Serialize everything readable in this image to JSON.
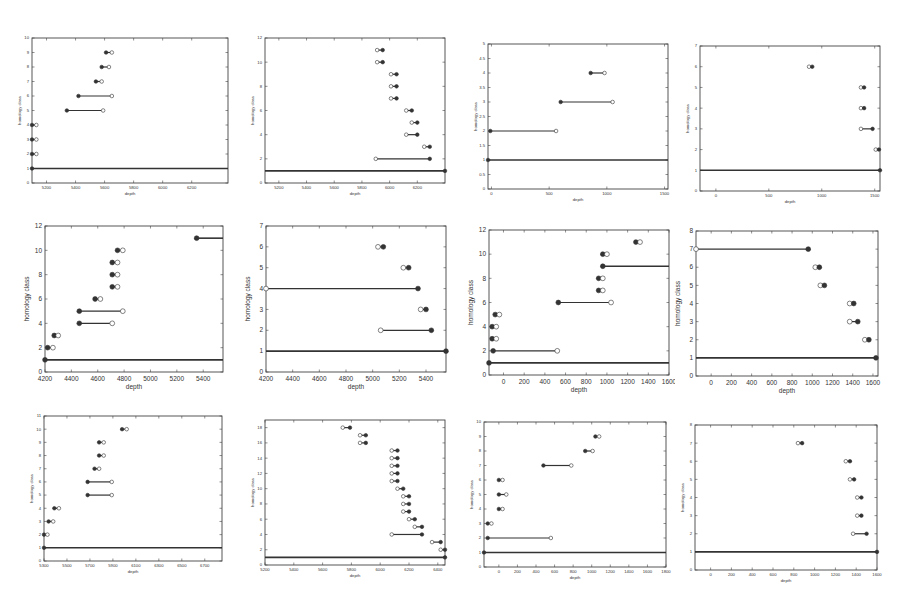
{
  "figure": {
    "common_xlabel": "depth",
    "common_ylabel": "homology class"
  },
  "chart_data": [
    {
      "id": "p1",
      "type": "interval",
      "row": 0,
      "col": 0,
      "xlabel": "depth",
      "ylabel": "homology class",
      "xlim": [
        5100,
        6450
      ],
      "ylim": [
        0,
        10
      ],
      "xticks": [
        5200,
        5400,
        5600,
        5800,
        6000,
        6200
      ],
      "yticks": [
        0,
        1,
        2,
        3,
        4,
        5,
        6,
        7,
        8,
        9,
        10
      ],
      "intervals": [
        {
          "y": 1,
          "x0": 5100,
          "x1": 6450,
          "infinite": true
        },
        {
          "y": 2,
          "x0": 5100,
          "x1": 5130
        },
        {
          "y": 3,
          "x0": 5100,
          "x1": 5130
        },
        {
          "y": 4,
          "x0": 5100,
          "x1": 5130
        },
        {
          "y": 5,
          "x0": 5340,
          "x1": 5590
        },
        {
          "y": 6,
          "x0": 5420,
          "x1": 5650
        },
        {
          "y": 7,
          "x0": 5540,
          "x1": 5580
        },
        {
          "y": 8,
          "x0": 5580,
          "x1": 5630
        },
        {
          "y": 9,
          "x0": 5610,
          "x1": 5650
        }
      ],
      "direction": "filled-start"
    },
    {
      "id": "p2",
      "type": "interval",
      "row": 0,
      "col": 1,
      "xlabel": "depth",
      "ylabel": "homology class",
      "xlim": [
        5100,
        6400
      ],
      "ylim": [
        0,
        12
      ],
      "xticks": [
        5200,
        5400,
        5600,
        5800,
        6000,
        6200
      ],
      "yticks": [
        0,
        2,
        4,
        6,
        8,
        10,
        12
      ],
      "intervals": [
        {
          "y": 1,
          "x0": 5100,
          "x1": 6400,
          "infinite": true
        },
        {
          "y": 2,
          "x0": 5900,
          "x1": 6290
        },
        {
          "y": 3,
          "x0": 6250,
          "x1": 6290
        },
        {
          "y": 4,
          "x0": 6120,
          "x1": 6200
        },
        {
          "y": 5,
          "x0": 6160,
          "x1": 6200
        },
        {
          "y": 6,
          "x0": 6120,
          "x1": 6160
        },
        {
          "y": 7,
          "x0": 6010,
          "x1": 6050
        },
        {
          "y": 8,
          "x0": 6010,
          "x1": 6050
        },
        {
          "y": 9,
          "x0": 6010,
          "x1": 6050
        },
        {
          "y": 10,
          "x0": 5910,
          "x1": 5950
        },
        {
          "y": 11,
          "x0": 5910,
          "x1": 5950
        }
      ],
      "direction": "filled-end"
    },
    {
      "id": "p3",
      "type": "interval",
      "row": 0,
      "col": 2,
      "xlabel": "depth",
      "ylabel": "homology class",
      "xlim": [
        -30,
        1530
      ],
      "ylim": [
        0,
        5
      ],
      "xticks": [
        0,
        500,
        1000,
        1500
      ],
      "yticks": [
        0,
        0.5,
        1,
        1.5,
        2,
        2.5,
        3,
        3.5,
        4,
        4.5,
        5
      ],
      "intervals": [
        {
          "y": 1,
          "x0": -30,
          "x1": 1530,
          "infinite": true
        },
        {
          "y": 2,
          "x0": -10,
          "x1": 560
        },
        {
          "y": 3,
          "x0": 600,
          "x1": 1050
        },
        {
          "y": 4,
          "x0": 860,
          "x1": 980
        }
      ],
      "direction": "filled-start"
    },
    {
      "id": "p4",
      "type": "interval",
      "row": 0,
      "col": 3,
      "xlabel": "depth",
      "ylabel": "homology class",
      "xlim": [
        -150,
        1550
      ],
      "ylim": [
        0,
        7
      ],
      "xticks": [
        0,
        500,
        1000,
        1500
      ],
      "yticks": [
        0,
        1,
        2,
        3,
        4,
        5,
        6,
        7
      ],
      "intervals": [
        {
          "y": 1,
          "x0": -150,
          "x1": 1550,
          "infinite": true
        },
        {
          "y": 2,
          "x0": 1510,
          "x1": 1540
        },
        {
          "y": 3,
          "x0": 1370,
          "x1": 1480
        },
        {
          "y": 4,
          "x0": 1370,
          "x1": 1400
        },
        {
          "y": 5,
          "x0": 1370,
          "x1": 1400
        },
        {
          "y": 6,
          "x0": 880,
          "x1": 910
        }
      ],
      "direction": "filled-end"
    },
    {
      "id": "p5",
      "type": "interval",
      "row": 1,
      "col": 0,
      "xlabel": "depth",
      "ylabel": "homology class",
      "xlim": [
        4200,
        5550
      ],
      "ylim": [
        0,
        12
      ],
      "xticks": [
        4200,
        4400,
        4600,
        4800,
        5000,
        5200,
        5400
      ],
      "yticks": [
        0,
        2,
        4,
        6,
        8,
        10,
        12
      ],
      "intervals": [
        {
          "y": 1,
          "x0": 4200,
          "x1": 5550,
          "infinite": true
        },
        {
          "y": 2,
          "x0": 4220,
          "x1": 4260
        },
        {
          "y": 3,
          "x0": 4270,
          "x1": 4300
        },
        {
          "y": 4,
          "x0": 4460,
          "x1": 4710
        },
        {
          "y": 5,
          "x0": 4460,
          "x1": 4790
        },
        {
          "y": 6,
          "x0": 4580,
          "x1": 4620
        },
        {
          "y": 7,
          "x0": 4710,
          "x1": 4750
        },
        {
          "y": 8,
          "x0": 4710,
          "x1": 4750
        },
        {
          "y": 9,
          "x0": 4710,
          "x1": 4750
        },
        {
          "y": 10,
          "x0": 4750,
          "x1": 4790
        },
        {
          "y": 11,
          "x0": 5350,
          "x1": 5550,
          "infinite": true
        }
      ],
      "direction": "filled-start"
    },
    {
      "id": "p6",
      "type": "interval",
      "row": 1,
      "col": 1,
      "xlabel": "depth",
      "ylabel": "homology class",
      "xlim": [
        4200,
        5550
      ],
      "ylim": [
        0,
        7
      ],
      "xticks": [
        4200,
        4400,
        4600,
        4800,
        5000,
        5200,
        5400
      ],
      "yticks": [
        0,
        1,
        2,
        3,
        4,
        5,
        6,
        7
      ],
      "intervals": [
        {
          "y": 1,
          "x0": 4200,
          "x1": 5550,
          "infinite": true
        },
        {
          "y": 2,
          "x0": 5060,
          "x1": 5440
        },
        {
          "y": 3,
          "x0": 5360,
          "x1": 5400
        },
        {
          "y": 4,
          "x0": 4200,
          "x1": 5340
        },
        {
          "y": 5,
          "x0": 5230,
          "x1": 5270
        },
        {
          "y": 6,
          "x0": 5040,
          "x1": 5080
        }
      ],
      "direction": "filled-end"
    },
    {
      "id": "p7",
      "type": "interval",
      "row": 1,
      "col": 2,
      "xlabel": "depth",
      "ylabel": "homology class",
      "xlim": [
        -140,
        1600
      ],
      "ylim": [
        0,
        12
      ],
      "xticks": [
        0,
        200,
        400,
        600,
        800,
        1000,
        1200,
        1400,
        1600
      ],
      "yticks": [
        0,
        2,
        4,
        6,
        8,
        10,
        12
      ],
      "intervals": [
        {
          "y": 1,
          "x0": -140,
          "x1": 1600,
          "infinite": true
        },
        {
          "y": 2,
          "x0": -100,
          "x1": 520
        },
        {
          "y": 3,
          "x0": -110,
          "x1": -70
        },
        {
          "y": 4,
          "x0": -110,
          "x1": -70
        },
        {
          "y": 5,
          "x0": -80,
          "x1": -40
        },
        {
          "y": 6,
          "x0": 530,
          "x1": 1040
        },
        {
          "y": 7,
          "x0": 920,
          "x1": 960
        },
        {
          "y": 8,
          "x0": 920,
          "x1": 960
        },
        {
          "y": 9,
          "x0": 960,
          "x1": 1600,
          "infinite": true
        },
        {
          "y": 10,
          "x0": 960,
          "x1": 1000
        },
        {
          "y": 11,
          "x0": 1280,
          "x1": 1320
        }
      ],
      "direction": "filled-start"
    },
    {
      "id": "p8",
      "type": "interval",
      "row": 1,
      "col": 3,
      "xlabel": "depth",
      "ylabel": "homology class",
      "xlim": [
        -150,
        1650
      ],
      "ylim": [
        0,
        8
      ],
      "xticks": [
        0,
        200,
        400,
        600,
        800,
        1000,
        1200,
        1400,
        1600
      ],
      "yticks": [
        0,
        1,
        2,
        3,
        4,
        5,
        6,
        7,
        8
      ],
      "intervals": [
        {
          "y": 1,
          "x0": -150,
          "x1": 1630,
          "infinite": true
        },
        {
          "y": 2,
          "x0": 1520,
          "x1": 1560
        },
        {
          "y": 3,
          "x0": 1370,
          "x1": 1450
        },
        {
          "y": 4,
          "x0": 1370,
          "x1": 1410
        },
        {
          "y": 5,
          "x0": 1080,
          "x1": 1120
        },
        {
          "y": 6,
          "x0": 1030,
          "x1": 1070
        },
        {
          "y": 7,
          "x0": -150,
          "x1": 960
        }
      ],
      "direction": "filled-end"
    },
    {
      "id": "p9",
      "type": "interval",
      "row": 2,
      "col": 0,
      "xlabel": "depth",
      "ylabel": "homology class",
      "xlim": [
        5300,
        6850
      ],
      "ylim": [
        0,
        11
      ],
      "xticks": [
        5300,
        5500,
        5700,
        5900,
        6100,
        6300,
        6500,
        6700
      ],
      "yticks": [
        0,
        1,
        2,
        3,
        4,
        5,
        6,
        7,
        8,
        9,
        10,
        11
      ],
      "intervals": [
        {
          "y": 1,
          "x0": 5300,
          "x1": 6850,
          "infinite": true
        },
        {
          "y": 2,
          "x0": 5300,
          "x1": 5330
        },
        {
          "y": 3,
          "x0": 5340,
          "x1": 5380
        },
        {
          "y": 4,
          "x0": 5390,
          "x1": 5430
        },
        {
          "y": 5,
          "x0": 5680,
          "x1": 5890
        },
        {
          "y": 6,
          "x0": 5680,
          "x1": 5890
        },
        {
          "y": 7,
          "x0": 5740,
          "x1": 5780
        },
        {
          "y": 8,
          "x0": 5780,
          "x1": 5820
        },
        {
          "y": 9,
          "x0": 5780,
          "x1": 5820
        },
        {
          "y": 10,
          "x0": 5980,
          "x1": 6020
        }
      ],
      "direction": "filled-start"
    },
    {
      "id": "p10",
      "type": "interval",
      "row": 2,
      "col": 1,
      "xlabel": "depth",
      "ylabel": "homology class",
      "xlim": [
        5200,
        6450
      ],
      "ylim": [
        0,
        19
      ],
      "xticks": [
        5200,
        5400,
        5600,
        5800,
        6000,
        6200,
        6400
      ],
      "yticks": [
        0,
        2,
        4,
        6,
        8,
        10,
        12,
        14,
        16,
        18
      ],
      "intervals": [
        {
          "y": 1,
          "x0": 5200,
          "x1": 6450,
          "infinite": true
        },
        {
          "y": 2,
          "x0": 6420,
          "x1": 6450
        },
        {
          "y": 3,
          "x0": 6360,
          "x1": 6420
        },
        {
          "y": 4,
          "x0": 6080,
          "x1": 6290
        },
        {
          "y": 5,
          "x0": 6240,
          "x1": 6290
        },
        {
          "y": 6,
          "x0": 6200,
          "x1": 6240
        },
        {
          "y": 7,
          "x0": 6160,
          "x1": 6200
        },
        {
          "y": 8,
          "x0": 6160,
          "x1": 6200
        },
        {
          "y": 9,
          "x0": 6160,
          "x1": 6200
        },
        {
          "y": 10,
          "x0": 6120,
          "x1": 6160
        },
        {
          "y": 11,
          "x0": 6080,
          "x1": 6120
        },
        {
          "y": 12,
          "x0": 6080,
          "x1": 6120
        },
        {
          "y": 13,
          "x0": 6080,
          "x1": 6120
        },
        {
          "y": 14,
          "x0": 6080,
          "x1": 6120
        },
        {
          "y": 15,
          "x0": 6080,
          "x1": 6120
        },
        {
          "y": 16,
          "x0": 5860,
          "x1": 5900
        },
        {
          "y": 17,
          "x0": 5860,
          "x1": 5900
        },
        {
          "y": 18,
          "x0": 5740,
          "x1": 5790
        }
      ],
      "direction": "filled-end"
    },
    {
      "id": "p11",
      "type": "interval",
      "row": 2,
      "col": 2,
      "xlabel": "depth",
      "ylabel": "homology class",
      "xlim": [
        -160,
        1800
      ],
      "ylim": [
        0,
        10
      ],
      "xticks": [
        0,
        200,
        400,
        600,
        800,
        1000,
        1200,
        1400,
        1600,
        1800
      ],
      "yticks": [
        0,
        1,
        2,
        3,
        4,
        5,
        6,
        7,
        8,
        9,
        10
      ],
      "intervals": [
        {
          "y": 1,
          "x0": -160,
          "x1": 1800,
          "infinite": true
        },
        {
          "y": 2,
          "x0": -120,
          "x1": 560
        },
        {
          "y": 3,
          "x0": -120,
          "x1": -80
        },
        {
          "y": 4,
          "x0": 0,
          "x1": 40
        },
        {
          "y": 5,
          "x0": 0,
          "x1": 80
        },
        {
          "y": 6,
          "x0": 0,
          "x1": 40
        },
        {
          "y": 7,
          "x0": 480,
          "x1": 780
        },
        {
          "y": 8,
          "x0": 930,
          "x1": 1010
        },
        {
          "y": 9,
          "x0": 1040,
          "x1": 1080
        }
      ],
      "direction": "filled-start"
    },
    {
      "id": "p12",
      "type": "interval",
      "row": 2,
      "col": 3,
      "xlabel": "depth",
      "ylabel": "homology class",
      "xlim": [
        -150,
        1600
      ],
      "ylim": [
        0,
        8
      ],
      "xticks": [
        0,
        200,
        400,
        600,
        800,
        1000,
        1200,
        1400,
        1600
      ],
      "yticks": [
        0,
        1,
        2,
        3,
        4,
        5,
        6,
        7,
        8
      ],
      "intervals": [
        {
          "y": 1,
          "x0": -150,
          "x1": 1600,
          "infinite": true
        },
        {
          "y": 2,
          "x0": 1370,
          "x1": 1500
        },
        {
          "y": 3,
          "x0": 1410,
          "x1": 1450
        },
        {
          "y": 4,
          "x0": 1410,
          "x1": 1450
        },
        {
          "y": 5,
          "x0": 1340,
          "x1": 1380
        },
        {
          "y": 6,
          "x0": 1300,
          "x1": 1340
        },
        {
          "y": 7,
          "x0": 840,
          "x1": 880
        }
      ],
      "direction": "filled-end"
    }
  ],
  "layout": {
    "panels": [
      {
        "id": "p1",
        "x": 32,
        "y": 38,
        "w": 196,
        "h": 145
      },
      {
        "id": "p2",
        "x": 265,
        "y": 38,
        "w": 180,
        "h": 145
      },
      {
        "id": "p3",
        "x": 488,
        "y": 44,
        "w": 180,
        "h": 145
      },
      {
        "id": "p4",
        "x": 700,
        "y": 46,
        "w": 180,
        "h": 145
      },
      {
        "id": "p5",
        "x": 45,
        "y": 226,
        "w": 178,
        "h": 146
      },
      {
        "id": "p6",
        "x": 266,
        "y": 226,
        "w": 180,
        "h": 146
      },
      {
        "id": "p7",
        "x": 489,
        "y": 230,
        "w": 180,
        "h": 145
      },
      {
        "id": "p8",
        "x": 696,
        "y": 231,
        "w": 182,
        "h": 145
      },
      {
        "id": "p9",
        "x": 44,
        "y": 416,
        "w": 178,
        "h": 145
      },
      {
        "id": "p10",
        "x": 265,
        "y": 420,
        "w": 180,
        "h": 145
      },
      {
        "id": "p11",
        "x": 484,
        "y": 422,
        "w": 182,
        "h": 145
      },
      {
        "id": "p12",
        "x": 695,
        "y": 425,
        "w": 182,
        "h": 145
      }
    ]
  }
}
